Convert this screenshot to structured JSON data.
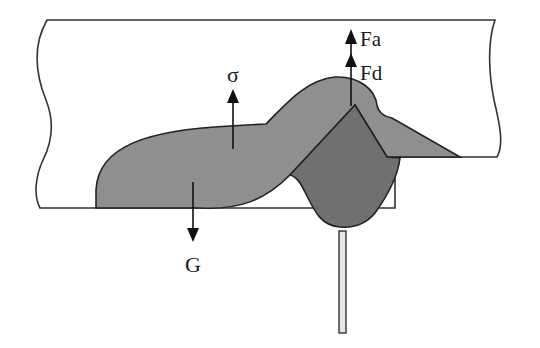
{
  "diagram": {
    "type": "weld-pool-force-diagram",
    "labels": {
      "surface_tension": "σ",
      "gravity": "G",
      "arc_force": "Fa",
      "droplet_force": "Fd"
    },
    "colors": {
      "background": "#ffffff",
      "workpiece_fill": "#ffffff",
      "outline": "#333333",
      "weld_bead_fill": "#8f8f8f",
      "molten_pool_fill": "#707070",
      "arrow": "#111111",
      "electrode_fill": "#e6e6e6"
    },
    "elements": [
      {
        "id": "workpiece",
        "description": "Plate cross-section with wavy break lines on left and right"
      },
      {
        "id": "weld-bead",
        "description": "Light grey solidified bead / reinforcement"
      },
      {
        "id": "molten-pool",
        "description": "Darker grey penetrating molten pool"
      },
      {
        "id": "electrode",
        "description": "Thin vertical rod below pool"
      },
      {
        "id": "arrow-sigma",
        "direction": "up",
        "label_key": "surface_tension"
      },
      {
        "id": "arrow-G",
        "direction": "down",
        "label_key": "gravity"
      },
      {
        "id": "arrow-Fa",
        "direction": "up",
        "label_key": "arc_force"
      },
      {
        "id": "arrow-Fd",
        "direction": "up",
        "label_key": "droplet_force"
      }
    ]
  }
}
